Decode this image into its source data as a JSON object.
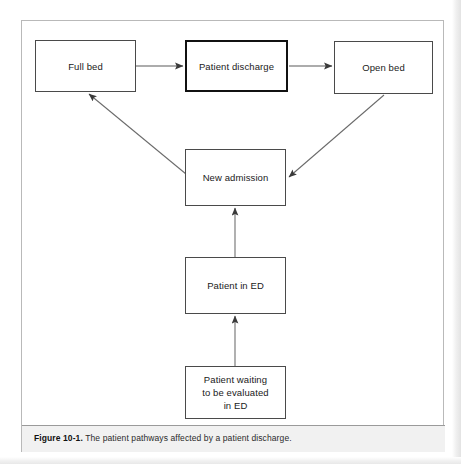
{
  "figure": {
    "caption_label": "Figure 10-1.",
    "caption_text": " The patient pathways affected by a patient discharge.",
    "colors": {
      "box_border": "#4a4a4a",
      "emphasis_border": "#111111",
      "arrow": "#555555",
      "frame_border": "#b9b9b9",
      "caption_background": "#f1f1f1",
      "page_background": "#ffffff",
      "text": "#1a1a1a"
    }
  },
  "diagram": {
    "type": "flowchart",
    "nodes": [
      {
        "id": "full-bed",
        "label": "Full bed",
        "emphasis": false
      },
      {
        "id": "discharge",
        "label": "Patient discharge",
        "emphasis": true
      },
      {
        "id": "open-bed",
        "label": "Open bed",
        "emphasis": false
      },
      {
        "id": "new-admission",
        "label": "New admission",
        "emphasis": false
      },
      {
        "id": "patient-ed",
        "label": "Patient in ED",
        "emphasis": false
      },
      {
        "id": "waiting",
        "label": "Patient waiting\nto be evaluated\nin ED",
        "emphasis": false
      }
    ],
    "edges": [
      {
        "from": "full-bed",
        "to": "discharge",
        "direction": "right"
      },
      {
        "from": "discharge",
        "to": "open-bed",
        "direction": "right"
      },
      {
        "from": "open-bed",
        "to": "new-admission",
        "direction": "diagonal-down-left"
      },
      {
        "from": "new-admission",
        "to": "full-bed",
        "direction": "diagonal-up-left"
      },
      {
        "from": "patient-ed",
        "to": "new-admission",
        "direction": "up"
      },
      {
        "from": "waiting",
        "to": "patient-ed",
        "direction": "up"
      }
    ]
  }
}
